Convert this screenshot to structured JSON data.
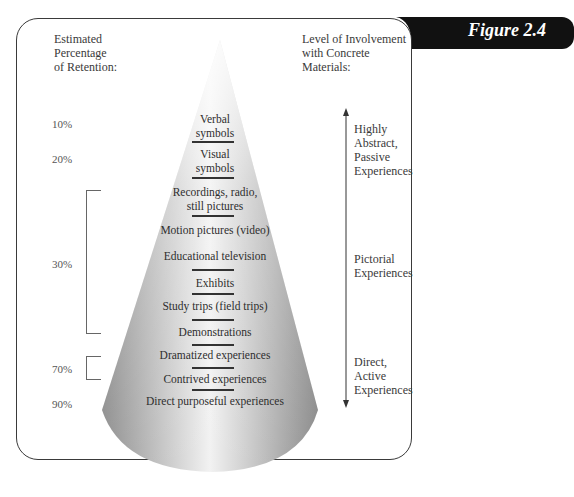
{
  "figure": {
    "label": "Figure 2.4",
    "tab_color": "#111111"
  },
  "headers": {
    "left": [
      "Estimated",
      "Percentage",
      "of Retention:"
    ],
    "right": [
      "Level of Involvement",
      "with Concrete",
      "Materials:"
    ]
  },
  "percentages": [
    {
      "label": "10%",
      "top": 118
    },
    {
      "label": "20%",
      "top": 153
    },
    {
      "label": "30%",
      "top": 258
    },
    {
      "label": "70%",
      "top": 363
    },
    {
      "label": "90%",
      "top": 398
    }
  ],
  "layers": [
    {
      "label": "Verbal\nsymbols",
      "lines": [
        "Verbal",
        "symbols"
      ]
    },
    {
      "label": "Visual symbols",
      "lines": [
        "Visual",
        "symbols"
      ]
    },
    {
      "label": "Recordings, radio, still pictures",
      "lines": [
        "Recordings, radio,",
        "still pictures"
      ]
    },
    {
      "label": "Motion pictures (video)",
      "lines": [
        "Motion pictures (video)"
      ]
    },
    {
      "label": "Educational television",
      "lines": [
        "Educational television"
      ]
    },
    {
      "label": "Exhibits",
      "lines": [
        "Exhibits"
      ]
    },
    {
      "label": "Study trips (field trips)",
      "lines": [
        "Study trips (field trips)"
      ]
    },
    {
      "label": "Demonstrations",
      "lines": [
        "Demonstrations"
      ]
    },
    {
      "label": "Dramatized experiences",
      "lines": [
        "Dramatized experiences"
      ]
    },
    {
      "label": "Contrived experiences",
      "lines": [
        "Contrived experiences"
      ]
    },
    {
      "label": "Direct purposeful experiences",
      "lines": [
        "Direct purposeful experiences"
      ]
    }
  ],
  "involvement": [
    {
      "lines": [
        "Highly",
        "Abstract,",
        "Passive",
        "Experiences"
      ]
    },
    {
      "lines": [
        "Pictorial",
        "Experiences"
      ]
    },
    {
      "lines": [
        "Direct,",
        "Active",
        "Experiences"
      ]
    }
  ],
  "colors": {
    "frame": "#3a3a3a",
    "cone_dark": "#8a8a8a",
    "cone_light": "#f4f4f4"
  }
}
